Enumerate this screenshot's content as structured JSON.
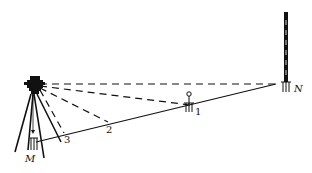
{
  "diagram": {
    "type": "surveying-level-setup",
    "colors": {
      "ink": "#111111",
      "background": "#ffffff"
    },
    "labels": {
      "start_point": "M",
      "end_point": "N",
      "point_1": "1",
      "point_2": "2",
      "point_3": "3"
    },
    "elements": [
      "total-station-on-tripod",
      "survey-rod",
      "ground-line",
      "sight-lines",
      "stakes"
    ]
  }
}
